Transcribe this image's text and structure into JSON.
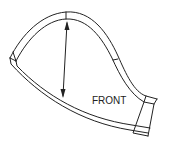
{
  "diagram": {
    "type": "pattern-piece",
    "label": "FRONT",
    "elements": [
      "outer-seam-line",
      "inner-seam-line",
      "top-notch",
      "side-notch",
      "left-end-cap",
      "right-end-cap",
      "measurement-arrow"
    ],
    "stroke_color": "#222222",
    "background_color": "#ffffff"
  }
}
